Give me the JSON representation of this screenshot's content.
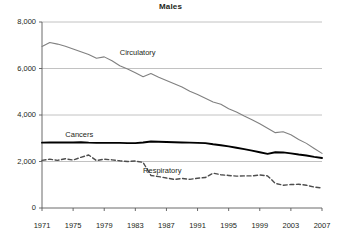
{
  "chart_data": {
    "type": "line",
    "title": "Males",
    "xlabel": "",
    "ylabel": "",
    "xlim": [
      1971,
      2007
    ],
    "ylim": [
      0,
      8000
    ],
    "grid": true,
    "legend_position": "inline-annotations",
    "xticks": [
      "1971",
      "1975",
      "1979",
      "1983",
      "1987",
      "1991",
      "1995",
      "1999",
      "2003",
      "2007"
    ],
    "yticks": [
      "0",
      "2,000",
      "4,000",
      "6,000",
      "8,000"
    ],
    "x": [
      1971,
      1972,
      1973,
      1974,
      1975,
      1976,
      1977,
      1978,
      1979,
      1980,
      1981,
      1982,
      1983,
      1984,
      1985,
      1986,
      1987,
      1988,
      1989,
      1990,
      1991,
      1992,
      1993,
      1994,
      1995,
      1996,
      1997,
      1998,
      1999,
      2000,
      2001,
      2002,
      2003,
      2004,
      2005,
      2006,
      2007
    ],
    "series": [
      {
        "name": "Circulatory",
        "color": "#808080",
        "style": "solid",
        "values": [
          6950,
          7120,
          7050,
          6960,
          6840,
          6720,
          6600,
          6440,
          6500,
          6330,
          6120,
          5980,
          5820,
          5650,
          5780,
          5620,
          5480,
          5340,
          5200,
          5020,
          4880,
          4720,
          4560,
          4460,
          4270,
          4130,
          3960,
          3800,
          3620,
          3430,
          3240,
          3280,
          3150,
          2950,
          2780,
          2560,
          2350
        ]
      },
      {
        "name": "Cancers",
        "color": "#000000",
        "style": "solid",
        "values": [
          2810,
          2820,
          2820,
          2820,
          2820,
          2830,
          2810,
          2800,
          2800,
          2800,
          2800,
          2790,
          2790,
          2820,
          2860,
          2850,
          2840,
          2830,
          2820,
          2810,
          2800,
          2790,
          2740,
          2700,
          2650,
          2590,
          2530,
          2470,
          2400,
          2330,
          2400,
          2390,
          2350,
          2300,
          2260,
          2200,
          2150
        ]
      },
      {
        "name": "Respiratory",
        "color": "#4d4d4d",
        "style": "dashed",
        "values": [
          2050,
          2100,
          2050,
          2120,
          2060,
          2180,
          2280,
          2040,
          2100,
          2070,
          2030,
          2000,
          2020,
          1960,
          1400,
          1350,
          1290,
          1230,
          1270,
          1230,
          1280,
          1310,
          1500,
          1430,
          1400,
          1370,
          1380,
          1380,
          1420,
          1380,
          1060,
          980,
          1010,
          1020,
          980,
          900,
          860
        ]
      }
    ],
    "annotations": [
      {
        "text": "Circulatory",
        "x": 1981,
        "y": 6650
      },
      {
        "text": "Cancers",
        "x": 1974,
        "y": 3150
      },
      {
        "text": "Respiratory",
        "x": 1984,
        "y": 1600
      }
    ]
  }
}
